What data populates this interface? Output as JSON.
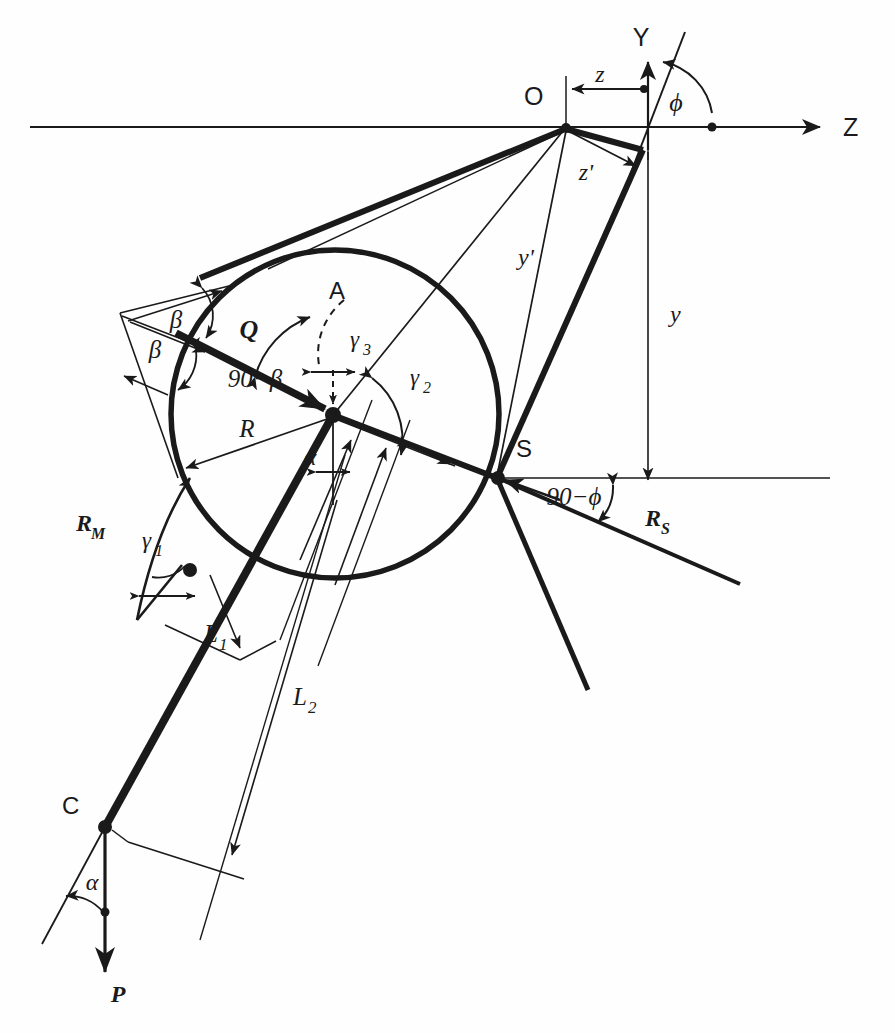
{
  "figure": {
    "type": "technical-vector-diagram",
    "background_color": "#fefefe",
    "ink_color": "#1a1a1a"
  },
  "axes": {
    "horizontal": {
      "label": "Z",
      "arrow": "right"
    },
    "vertical": {
      "label": "Y",
      "arrow": "up"
    },
    "origin_label": "O"
  },
  "points": [
    {
      "id": "O",
      "label": "O",
      "x": 566,
      "y": 127
    },
    {
      "id": "A",
      "label": "A",
      "x": 339,
      "y": 293
    },
    {
      "id": "S",
      "label": "S",
      "x": 497,
      "y": 478
    },
    {
      "id": "C",
      "label": "C",
      "x": 105,
      "y": 827
    },
    {
      "id": "Y",
      "label": "Y",
      "x": 648,
      "y": 38
    },
    {
      "id": "Z",
      "label": "Z",
      "x": 846,
      "y": 127
    }
  ],
  "vectors": [
    {
      "name": "Q",
      "label": "Q",
      "style": "bold-italic"
    },
    {
      "name": "P",
      "label": "P",
      "style": "bold-italic"
    },
    {
      "name": "R_M",
      "label": "R",
      "sub": "M",
      "style": "bold-italic"
    },
    {
      "name": "R_S",
      "label": "R",
      "sub": "S",
      "style": "bold-italic"
    }
  ],
  "dimensions": [
    {
      "name": "R",
      "label": "R"
    },
    {
      "name": "L1",
      "label": "L",
      "sub": "1"
    },
    {
      "name": "L2",
      "label": "L",
      "sub": "2"
    },
    {
      "name": "y",
      "label": "y"
    },
    {
      "name": "yprime",
      "label": "y'"
    },
    {
      "name": "z",
      "label": "z"
    },
    {
      "name": "zprime",
      "label": "z'"
    }
  ],
  "angles": [
    {
      "name": "alpha",
      "label": "α"
    },
    {
      "name": "alpha2",
      "label": "α"
    },
    {
      "name": "beta-upper",
      "label": "β"
    },
    {
      "name": "beta-lower",
      "label": "β"
    },
    {
      "name": "ninety-minus-beta",
      "label": "90−β"
    },
    {
      "name": "ninety-minus-phi",
      "label": "90−ϕ"
    },
    {
      "name": "phi",
      "label": "ϕ"
    },
    {
      "name": "gamma1",
      "label": "γ",
      "sub": "1"
    },
    {
      "name": "gamma2",
      "label": "γ",
      "sub": "2"
    },
    {
      "name": "gamma3",
      "label": "γ",
      "sub": "3"
    }
  ],
  "circle": {
    "cx": 335,
    "cy": 414,
    "r": 164
  }
}
